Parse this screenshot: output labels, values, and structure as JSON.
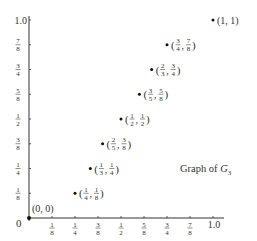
{
  "chart_data": {
    "type": "scatter",
    "title": "Graph of G3",
    "title_display": "Graph of ",
    "title_symbol": "G",
    "title_subscript": "3",
    "xlabel": "",
    "ylabel": "",
    "xlim": [
      0,
      1
    ],
    "ylim": [
      0,
      1
    ],
    "grid": false,
    "legend": "none",
    "origin_label": "0",
    "x_ticks": [
      {
        "value": 0.125,
        "num": "1",
        "den": "8"
      },
      {
        "value": 0.25,
        "num": "1",
        "den": "4"
      },
      {
        "value": 0.375,
        "num": "3",
        "den": "8"
      },
      {
        "value": 0.5,
        "num": "1",
        "den": "2"
      },
      {
        "value": 0.625,
        "num": "5",
        "den": "8"
      },
      {
        "value": 0.75,
        "num": "3",
        "den": "4"
      },
      {
        "value": 0.875,
        "num": "7",
        "den": "8"
      },
      {
        "value": 1.0,
        "label": "1.0"
      }
    ],
    "y_ticks": [
      {
        "value": 0.125,
        "num": "1",
        "den": "8"
      },
      {
        "value": 0.25,
        "num": "1",
        "den": "4"
      },
      {
        "value": 0.375,
        "num": "3",
        "den": "8"
      },
      {
        "value": 0.5,
        "num": "1",
        "den": "2"
      },
      {
        "value": 0.625,
        "num": "5",
        "den": "8"
      },
      {
        "value": 0.75,
        "num": "3",
        "den": "4"
      },
      {
        "value": 0.875,
        "num": "7",
        "den": "8"
      },
      {
        "value": 1.0,
        "label": "1.0"
      }
    ],
    "points": [
      {
        "x": 0,
        "y": 0,
        "label": "(0, 0)"
      },
      {
        "x": 0.25,
        "y": 0.125,
        "label": "(1/4, 1/8)",
        "xn": "1",
        "xd": "4",
        "yn": "1",
        "yd": "8"
      },
      {
        "x": 0.3333,
        "y": 0.25,
        "label": "(1/3, 1/4)",
        "xn": "1",
        "xd": "3",
        "yn": "1",
        "yd": "4"
      },
      {
        "x": 0.4,
        "y": 0.375,
        "label": "(2/5, 3/8)",
        "xn": "2",
        "xd": "5",
        "yn": "3",
        "yd": "8"
      },
      {
        "x": 0.5,
        "y": 0.5,
        "label": "(1/2, 1/2)",
        "xn": "1",
        "xd": "2",
        "yn": "1",
        "yd": "2"
      },
      {
        "x": 0.6,
        "y": 0.625,
        "label": "(3/5, 5/8)",
        "xn": "3",
        "xd": "5",
        "yn": "5",
        "yd": "8"
      },
      {
        "x": 0.6667,
        "y": 0.75,
        "label": "(2/3, 3/4)",
        "xn": "2",
        "xd": "3",
        "yn": "3",
        "yd": "4"
      },
      {
        "x": 0.75,
        "y": 0.875,
        "label": "(3/4, 7/8)",
        "xn": "3",
        "xd": "4",
        "yn": "7",
        "yd": "8"
      },
      {
        "x": 1,
        "y": 1,
        "label": "(1, 1)"
      }
    ],
    "colors": {
      "axis": "#333333",
      "point": "#111111",
      "text": "#333333"
    }
  }
}
